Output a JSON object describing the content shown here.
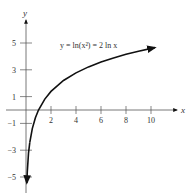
{
  "chart_data": {
    "type": "line",
    "title": "",
    "xlabel": "x",
    "ylabel": "y",
    "xlim": [
      -1.6,
      12.5
    ],
    "ylim": [
      -5.5,
      7
    ],
    "grid": false,
    "legend": "none",
    "x_ticks": [
      2,
      4,
      6,
      8,
      10
    ],
    "y_ticks": [
      5,
      3,
      1,
      -1,
      -3,
      -5
    ],
    "annotations": [
      {
        "text": "y = ln(x²) = 2 ln x",
        "x": 5.5,
        "y": 5
      }
    ],
    "series": [
      {
        "name": "y = 2 ln x",
        "x": [
          0.066,
          0.1,
          0.2,
          0.3,
          0.5,
          0.75,
          1,
          1.5,
          2,
          3,
          4,
          5,
          6,
          7,
          8,
          9,
          10.3
        ],
        "values": [
          -5.44,
          -4.61,
          -3.22,
          -2.41,
          -1.39,
          -0.58,
          0,
          0.81,
          1.39,
          2.2,
          2.77,
          3.22,
          3.58,
          3.89,
          4.16,
          4.39,
          4.66
        ],
        "color": "#111111"
      }
    ]
  },
  "labels": {
    "x_axis": "x",
    "y_axis": "y",
    "equation": "y = ln(x²) = 2 ln x",
    "x_ticks": [
      "2",
      "4",
      "6",
      "8",
      "10"
    ],
    "y_ticks": [
      "5",
      "3",
      "1",
      "−1",
      "−3",
      "−5"
    ]
  }
}
